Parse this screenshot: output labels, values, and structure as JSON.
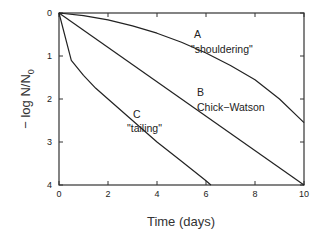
{
  "chart_data": {
    "type": "line",
    "title": "",
    "xlabel": "Time (days)",
    "ylabel": "− log N/N₀",
    "ylabel_parts": {
      "prefix": "− log N/N",
      "subscript": "0"
    },
    "xlim": [
      0,
      10
    ],
    "ylim": [
      0,
      4
    ],
    "y_inverted": true,
    "grid": false,
    "legend": "none (curves labeled inline)",
    "x_ticks": [
      0,
      2,
      4,
      6,
      8,
      10
    ],
    "y_ticks": [
      0,
      1,
      2,
      3,
      4
    ],
    "x_tick_labels": [
      "0",
      "2",
      "4",
      "6",
      "8",
      "10"
    ],
    "y_tick_labels": [
      "0",
      "1",
      "2",
      "3",
      "4"
    ],
    "series": [
      {
        "name": "A \"shouldering\"",
        "label_line1": "A",
        "label_line2": "\"shouldering\"",
        "x": [
          0,
          1,
          2,
          3,
          4,
          5,
          6,
          7,
          8,
          9,
          10
        ],
        "y": [
          0,
          0.06,
          0.16,
          0.3,
          0.47,
          0.68,
          0.93,
          1.22,
          1.55,
          2.0,
          2.55
        ]
      },
      {
        "name": "B Chick-Watson",
        "label_line1": "B",
        "label_line2": "Chick−Watson",
        "x": [
          0,
          10
        ],
        "y": [
          0,
          4
        ]
      },
      {
        "name": "C \"tailing\"",
        "label_line1": "C",
        "label_line2": "\"tailing\"",
        "x": [
          0,
          0.5,
          1,
          1.5,
          2,
          3,
          4,
          5,
          6,
          6.2
        ],
        "y": [
          0,
          1.1,
          1.45,
          1.75,
          2.0,
          2.5,
          3.0,
          3.45,
          3.9,
          4.0
        ]
      }
    ]
  }
}
